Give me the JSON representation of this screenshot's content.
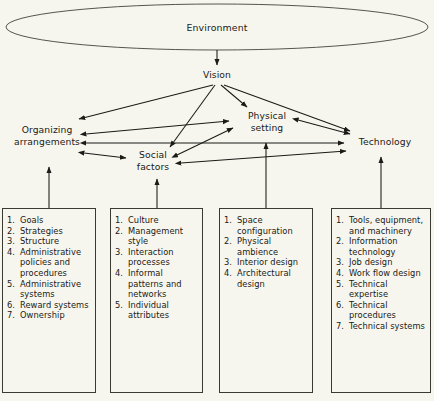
{
  "figure": {
    "background_color": "#f7f6ee",
    "line_color": "#1a1a17"
  },
  "nodes": {
    "environment": "Environment",
    "vision": "Vision",
    "organizing_arrangements": "Organizing\narrangements",
    "social_factors": "Social\nfactors",
    "physical_setting": "Physical\nsetting",
    "technology": "Technology"
  },
  "boxes": [
    {
      "id": "organizing-arrangements-box",
      "items": [
        "Goals",
        "Strategies",
        "Structure",
        "Administrative policies and procedures",
        "Administrative systems",
        "Reward systems",
        "Ownership"
      ]
    },
    {
      "id": "social-factors-box",
      "items": [
        "Culture",
        "Management style",
        "Interaction processes",
        "Informal patterns and networks",
        "Individual attributes"
      ]
    },
    {
      "id": "physical-setting-box",
      "items": [
        "Space configuration",
        "Physical ambience",
        "Interior design",
        "Architectural design"
      ]
    },
    {
      "id": "technology-box",
      "items": [
        "Tools, equipment, and machinery",
        "Information technology",
        "Job design",
        "Work flow design",
        "Technical expertise",
        "Technical procedures",
        "Technical systems"
      ]
    }
  ],
  "connections": [
    {
      "from": "environment",
      "to": "vision",
      "style": "single"
    },
    {
      "from": "vision",
      "to": "organizing_arrangements",
      "style": "single"
    },
    {
      "from": "vision",
      "to": "social_factors",
      "style": "single"
    },
    {
      "from": "vision",
      "to": "physical_setting",
      "style": "single"
    },
    {
      "from": "vision",
      "to": "technology",
      "style": "single"
    },
    {
      "from": "organizing_arrangements",
      "to": "physical_setting",
      "style": "double"
    },
    {
      "from": "organizing_arrangements",
      "to": "technology",
      "style": "double"
    },
    {
      "from": "organizing_arrangements",
      "to": "social_factors",
      "style": "double"
    },
    {
      "from": "social_factors",
      "to": "physical_setting",
      "style": "double"
    },
    {
      "from": "social_factors",
      "to": "technology",
      "style": "double"
    },
    {
      "from": "physical_setting",
      "to": "technology",
      "style": "double"
    },
    {
      "from": "organizing-arrangements-box",
      "to": "organizing_arrangements",
      "style": "single"
    },
    {
      "from": "social-factors-box",
      "to": "social_factors",
      "style": "single"
    },
    {
      "from": "physical-setting-box",
      "to": "physical_setting",
      "style": "single"
    },
    {
      "from": "technology-box",
      "to": "technology",
      "style": "single"
    }
  ]
}
